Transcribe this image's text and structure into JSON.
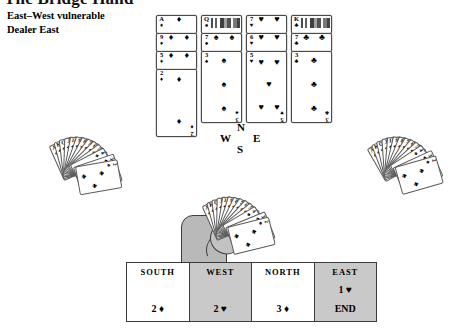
{
  "header": {
    "title": "The Bridge Hand",
    "vulnerability": "East–West vulnerable",
    "dealer": "Dealer East"
  },
  "compass": {
    "north": "N",
    "south": "S",
    "east": "E",
    "west": "W"
  },
  "trick": {
    "columns": [
      {
        "name": "diamond-stack",
        "cards": [
          {
            "rank": "A",
            "suit": "♦",
            "pips": 1
          },
          {
            "rank": "9",
            "suit": "♦",
            "pips": 9
          },
          {
            "rank": "5",
            "suit": "♦",
            "pips": 5
          },
          {
            "rank": "2",
            "suit": "♦",
            "pips": 2
          }
        ]
      },
      {
        "name": "spade-stack",
        "cards": [
          {
            "rank": "Q",
            "suit": "♠",
            "pips": 0,
            "face": true
          },
          {
            "rank": "7",
            "suit": "♠",
            "pips": 7
          },
          {
            "rank": "3",
            "suit": "♠",
            "pips": 3
          }
        ]
      },
      {
        "name": "heart-stack",
        "cards": [
          {
            "rank": "7",
            "suit": "♥",
            "pips": 7
          },
          {
            "rank": "6",
            "suit": "♥",
            "pips": 6
          },
          {
            "rank": "5",
            "suit": "♥",
            "pips": 5
          }
        ]
      },
      {
        "name": "club-stack",
        "cards": [
          {
            "rank": "K",
            "suit": "♣",
            "pips": 0,
            "face": true
          },
          {
            "rank": "7",
            "suit": "♣",
            "pips": 7
          },
          {
            "rank": "3",
            "suit": "♣",
            "pips": 3
          }
        ]
      }
    ]
  },
  "hands": {
    "west_fan": {
      "label": "West hand fan",
      "count": 13,
      "cards": [
        "A",
        "K",
        "Q",
        "J",
        "10",
        "9",
        "8",
        "7",
        "6",
        "5",
        "4",
        "3",
        "2"
      ],
      "suit": "♣"
    },
    "east_fan": {
      "label": "East hand fan",
      "count": 13,
      "cards": [
        "A",
        "K",
        "Q",
        "J",
        "10",
        "9",
        "8",
        "7",
        "6",
        "5",
        "4",
        "3",
        "2"
      ],
      "suit": "♣"
    },
    "south_fan": {
      "label": "South hand fan held in hand",
      "count": 13,
      "cards": [
        "A",
        "K",
        "Q",
        "J",
        "10",
        "9",
        "8",
        "7",
        "6",
        "5",
        "4",
        "3",
        "2"
      ],
      "suit": "♣"
    }
  },
  "bidding": {
    "columns": [
      {
        "seat": "SOUTH",
        "shaded": false,
        "calls": [
          "2 ♦"
        ]
      },
      {
        "seat": "WEST",
        "shaded": true,
        "calls": [
          "2 ♥"
        ]
      },
      {
        "seat": "NORTH",
        "shaded": false,
        "calls": [
          "3 ♦"
        ]
      },
      {
        "seat": "EAST",
        "shaded": true,
        "calls": [
          "1 ♥",
          "END"
        ]
      }
    ]
  },
  "colors": {
    "card_border": "#4a4a4a",
    "shaded_cell": "#c9c9c9",
    "hand_fill": "#b9b9b9",
    "ink": "#000000"
  }
}
